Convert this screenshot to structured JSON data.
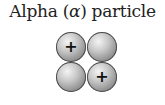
{
  "title": {
    "prefix": "Alpha (",
    "symbol": "α",
    "suffix": ") particle"
  },
  "particles": [
    {
      "type": "proton",
      "sign": "+"
    },
    {
      "type": "neutron",
      "sign": ""
    },
    {
      "type": "neutron",
      "sign": ""
    },
    {
      "type": "proton",
      "sign": "+"
    }
  ]
}
